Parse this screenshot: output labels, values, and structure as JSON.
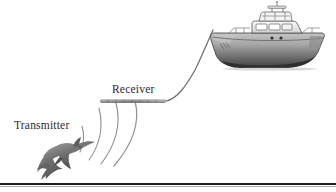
{
  "figure": {
    "background_color": "#ffffff",
    "width": 336,
    "height": 192
  },
  "labels": {
    "transmitter": "Transmitter",
    "receiver": "Receiver",
    "text_color": "#2b2b2b"
  },
  "elements": {
    "dolphin": {
      "name": "dolphin",
      "role": "transmitter",
      "color": "#7a7a7a",
      "outline_color": "#4a4a4a"
    },
    "sound_waves": {
      "name": "acoustic-wave-arcs",
      "count": 4,
      "color": "#8c8c8c",
      "origin_x": 58,
      "origin_y": 158
    },
    "hydrophone_array": {
      "name": "towed-hydrophone-array",
      "color": "#8f8f8f",
      "x1": 100,
      "x2": 166,
      "y": 101
    },
    "tow_cable": {
      "name": "tow-cable",
      "color": "#6e6e6e",
      "from_x": 166,
      "from_y": 101,
      "to_x": 213,
      "to_y": 30
    },
    "boat": {
      "name": "research-vessel",
      "type": "cabin-cruiser",
      "hull_top_color": "#b6b6b6",
      "hull_bottom_color": "#4c4c4c",
      "cabin_color": "#efefef",
      "outline_color": "#3b3b3b"
    },
    "baseline_rule": {
      "name": "bottom-rule",
      "color": "#1e1e1e",
      "y": 184,
      "thickness": 2
    }
  },
  "colors": {
    "gray_dark": "#3b3b3b",
    "gray_mid": "#8c8c8c",
    "gray_light": "#c8c8c8",
    "white": "#ffffff"
  }
}
